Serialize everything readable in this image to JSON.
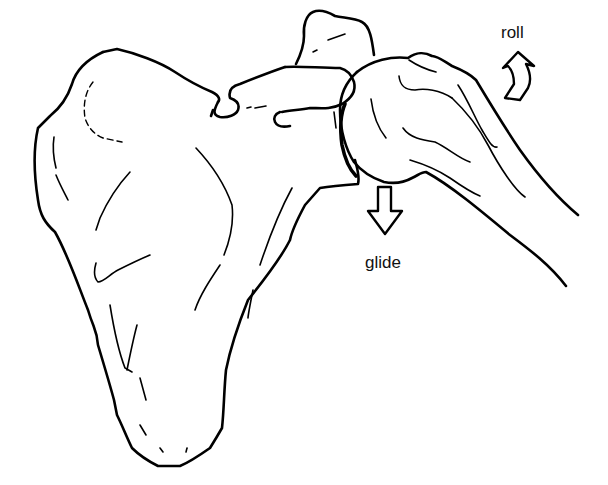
{
  "figure": {
    "labels": {
      "roll": "roll",
      "glide": "glide"
    },
    "arrows": [
      {
        "name": "roll-arrow",
        "direction": "up-right (curved)"
      },
      {
        "name": "glide-arrow",
        "direction": "down"
      }
    ],
    "colors": {
      "line": "#000000",
      "background": "#ffffff"
    }
  }
}
